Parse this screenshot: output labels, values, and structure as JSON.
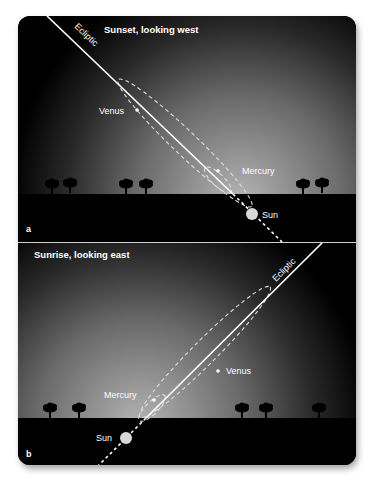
{
  "panels": [
    {
      "id": "a",
      "letter": "a",
      "title": "Sunset, looking west",
      "ecliptic_label": "Ecliptic",
      "labels": {
        "venus": "Venus",
        "mercury": "Mercury",
        "sun": "Sun"
      }
    },
    {
      "id": "b",
      "letter": "b",
      "title": "Sunrise, looking east",
      "ecliptic_label": "Ecliptic",
      "labels": {
        "venus": "Venus",
        "mercury": "Mercury",
        "sun": "Sun"
      }
    }
  ],
  "colors": {
    "sky_dark": "#000000",
    "sky_glow": "#9a9a9a",
    "ground": "#000000",
    "line": "#ffffff",
    "sun": "#d8d8d8"
  }
}
